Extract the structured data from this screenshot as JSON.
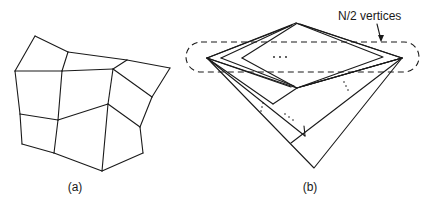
{
  "figures": [
    {
      "id": "a",
      "caption": "(a)",
      "description": "planar quadrilateral mesh",
      "vertices": {
        "A": [
          35,
          36
        ],
        "B": [
          68,
          52
        ],
        "C": [
          127,
          60
        ],
        "D": [
          170,
          68
        ],
        "E": [
          15,
          71
        ],
        "F": [
          62,
          71
        ],
        "G": [
          113,
          69
        ],
        "H": [
          152,
          97
        ],
        "I": [
          20,
          114
        ],
        "J": [
          58,
          120
        ],
        "K": [
          108,
          104
        ],
        "L": [
          140,
          127
        ],
        "M": [
          143,
          153
        ],
        "N": [
          22,
          144
        ],
        "O": [
          54,
          153
        ],
        "P": [
          102,
          171
        ]
      },
      "edges": [
        [
          "A",
          "B"
        ],
        [
          "B",
          "C"
        ],
        [
          "C",
          "D"
        ],
        [
          "A",
          "E"
        ],
        [
          "B",
          "F"
        ],
        [
          "E",
          "F"
        ],
        [
          "F",
          "G"
        ],
        [
          "G",
          "C"
        ],
        [
          "D",
          "H"
        ],
        [
          "G",
          "H"
        ],
        [
          "H",
          "L"
        ],
        [
          "G",
          "K"
        ],
        [
          "K",
          "L"
        ],
        [
          "L",
          "M"
        ],
        [
          "M",
          "P"
        ],
        [
          "K",
          "P"
        ],
        [
          "E",
          "I"
        ],
        [
          "I",
          "J"
        ],
        [
          "F",
          "J"
        ],
        [
          "J",
          "K"
        ],
        [
          "I",
          "N"
        ],
        [
          "N",
          "O"
        ],
        [
          "J",
          "O"
        ],
        [
          "O",
          "P"
        ]
      ]
    },
    {
      "id": "b",
      "caption": "(b)",
      "description": "nested diamonds with N/2 vertices enclosed in dashed region",
      "annotation": "N/2 vertices",
      "ellipsis_inner": "...",
      "dashed_region": {
        "x": 186,
        "y": 42,
        "width": 233,
        "height": 30,
        "rx": 15
      },
      "vertices": {
        "T": [
          296,
          23
        ],
        "Bm": [
          297,
          88
        ],
        "L1": [
          207,
          58
        ],
        "L2": [
          221,
          58
        ],
        "L3": [
          242,
          58
        ],
        "R1": [
          402,
          58
        ],
        "R2": [
          383,
          57
        ],
        "Apex": [
          314,
          168
        ],
        "S1": [
          273,
          104
        ],
        "S2": [
          291,
          126
        ],
        "S3": [
          296,
          143
        ]
      }
    }
  ]
}
